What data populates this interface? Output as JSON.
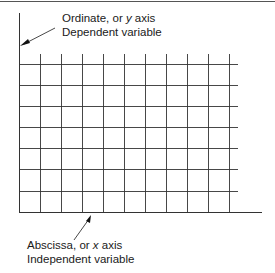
{
  "diagram": {
    "y_axis_label": {
      "line1_prefix": "Ordinate, or ",
      "line1_var": "y",
      "line1_suffix": " axis",
      "line2": "Dependent variable"
    },
    "x_axis_label": {
      "line1_prefix": "Abscissa, or ",
      "line1_var": "x",
      "line1_suffix": " axis",
      "line2": "Independent variable"
    },
    "grid": {
      "columns": 10,
      "rows": 7
    },
    "colors": {
      "line": "#333333",
      "text": "#1a1a1a",
      "background": "#ffffff"
    }
  }
}
